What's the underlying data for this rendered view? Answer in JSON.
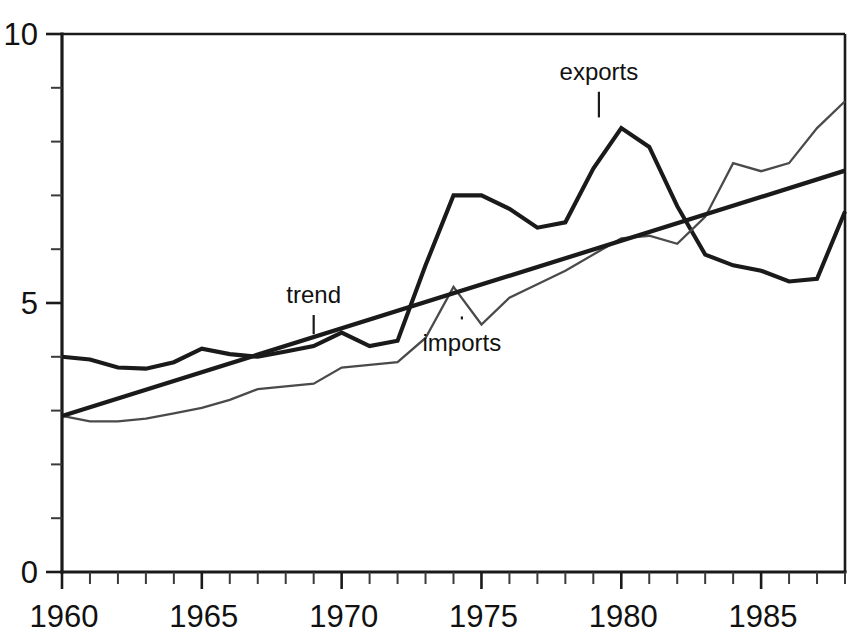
{
  "chart_data": {
    "type": "line",
    "title": "",
    "xlabel": "",
    "ylabel": "",
    "xlim": [
      1960,
      1988
    ],
    "ylim": [
      0,
      10
    ],
    "grid": false,
    "legend_position": "inline-annotations",
    "x_tick_labels": [
      "1960",
      "1965",
      "1970",
      "1975",
      "1980",
      "1985"
    ],
    "x_tick_values": [
      1960,
      1965,
      1970,
      1975,
      1980,
      1985
    ],
    "x_minor_tick_step": 1,
    "y_tick_labels": [
      "0",
      "5",
      "10"
    ],
    "y_tick_values": [
      0,
      5,
      10
    ],
    "y_minor_tick_step": 1,
    "x": [
      1960,
      1961,
      1962,
      1963,
      1964,
      1965,
      1966,
      1967,
      1968,
      1969,
      1970,
      1971,
      1972,
      1973,
      1974,
      1975,
      1976,
      1977,
      1978,
      1979,
      1980,
      1981,
      1982,
      1983,
      1984,
      1985,
      1986,
      1987,
      1988
    ],
    "series": [
      {
        "name": "exports",
        "style": "thick-solid",
        "color": "#1a1a1a",
        "values": [
          4.0,
          3.95,
          3.8,
          3.78,
          3.9,
          4.15,
          4.05,
          4.0,
          4.1,
          4.2,
          4.45,
          4.2,
          4.3,
          5.7,
          7.0,
          7.0,
          6.75,
          6.4,
          6.5,
          7.5,
          8.25,
          7.9,
          6.8,
          5.9,
          5.7,
          5.6,
          5.4,
          5.45,
          6.7
        ]
      },
      {
        "name": "imports",
        "style": "thin-solid",
        "color": "#4a4a4a",
        "values": [
          2.9,
          2.8,
          2.8,
          2.85,
          2.95,
          3.05,
          3.2,
          3.4,
          3.45,
          3.5,
          3.8,
          3.85,
          3.9,
          4.35,
          5.3,
          4.6,
          5.1,
          5.35,
          5.6,
          5.9,
          6.2,
          6.25,
          6.1,
          6.6,
          7.6,
          7.45,
          7.6,
          8.25,
          8.75
        ]
      },
      {
        "name": "trend",
        "style": "thick-straight",
        "color": "#1a1a1a",
        "values": [
          2.9,
          3.06,
          3.22,
          3.39,
          3.55,
          3.71,
          3.88,
          4.04,
          4.2,
          4.36,
          4.53,
          4.69,
          4.85,
          5.02,
          5.18,
          5.34,
          5.5,
          5.67,
          5.83,
          5.99,
          6.16,
          6.32,
          6.48,
          6.64,
          6.81,
          6.97,
          7.13,
          7.3,
          7.46
        ]
      }
    ],
    "annotations": [
      {
        "text": "trend",
        "x": 1969.0,
        "y": 5.0,
        "leader_to_y": 4.42
      },
      {
        "text": "imports",
        "x": 1974.3,
        "y": 4.1,
        "leader_to_y": 4.75
      },
      {
        "text": "exports",
        "x": 1979.2,
        "y": 9.15,
        "leader_to_y": 8.45
      }
    ]
  }
}
